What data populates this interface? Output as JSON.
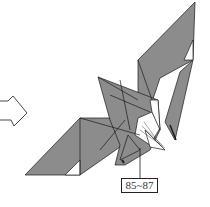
{
  "diagram": {
    "step_label": "85~87",
    "colors": {
      "paper_fill": "#8c8c8c",
      "paper_light": "#ffffff",
      "stroke": "#1a1a1a",
      "background": "#ffffff"
    },
    "icons": {
      "arrow": "hollow-right-arrow-icon"
    }
  }
}
